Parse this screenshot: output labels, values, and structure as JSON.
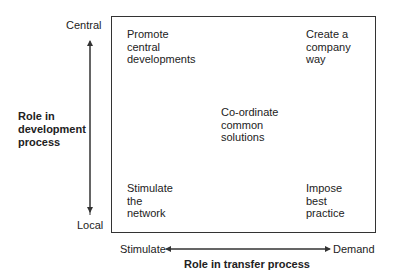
{
  "y_axis": {
    "title": "Role in\ndevelopment\nprocess",
    "top_label": "Central",
    "bottom_label": "Local"
  },
  "x_axis": {
    "title": "Role in transfer process",
    "left_label": "Stimulate",
    "right_label": "Demand"
  },
  "quadrants": {
    "top_left": "Promote\ncentral\ndevelopments",
    "top_right": "Create a\ncompany\nway",
    "center": "Co-ordinate\ncommon\nsolutions",
    "bottom_left": "Stimulate\nthe\nnetwork",
    "bottom_right": "Impose\nbest\npractice"
  },
  "colors": {
    "line": "#333333",
    "text": "#222222"
  }
}
